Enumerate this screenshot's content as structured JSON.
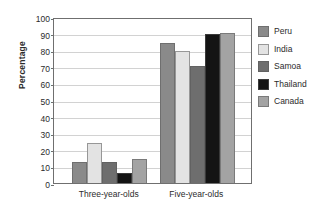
{
  "chart_data": {
    "type": "bar",
    "title": "",
    "xlabel": "",
    "ylabel": "Percentage",
    "ylim": [
      0,
      100
    ],
    "ytick_step": 10,
    "yticks": [
      0,
      10,
      20,
      30,
      40,
      50,
      60,
      70,
      80,
      90,
      100
    ],
    "grid": true,
    "legend_position": "right",
    "categories": [
      "Three-year-olds",
      "Five-year-olds"
    ],
    "series": [
      {
        "name": "Peru",
        "color": "#8a8a8a",
        "values": [
          12.5,
          84.5
        ]
      },
      {
        "name": "India",
        "color": "#e3e3e3",
        "values": [
          24.0,
          79.5
        ]
      },
      {
        "name": "Samoa",
        "color": "#6e6e6e",
        "values": [
          12.5,
          70.5
        ]
      },
      {
        "name": "Thailand",
        "color": "#141414",
        "values": [
          6.0,
          90.0
        ]
      },
      {
        "name": "Canada",
        "color": "#a3a3a3",
        "values": [
          14.5,
          90.5
        ]
      }
    ]
  }
}
